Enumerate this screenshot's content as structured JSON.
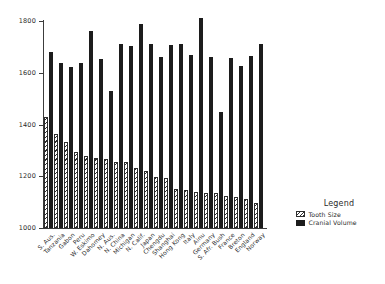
{
  "chart_data": {
    "type": "bar",
    "title": "",
    "subtitle": "",
    "xlabel": "",
    "ylabel": "",
    "ylim": [
      1000,
      1800
    ],
    "yticks": [
      1000,
      1200,
      1400,
      1600,
      1800
    ],
    "grid": false,
    "legend": {
      "title": "Legend",
      "position": "right",
      "entries": [
        {
          "name": "Tooth Size",
          "pattern": "diagonal-hatch"
        },
        {
          "name": "Cranial Volume",
          "pattern": "solid-black"
        }
      ]
    },
    "categories": [
      "S. Aus.",
      "Tanzania",
      "Gabon",
      "Peru",
      "W. Eskimo",
      "Dahomey",
      "N. Aus.",
      "N. China",
      "Michigan",
      "N. Calif.",
      "Japan",
      "Chengdu",
      "Shanghai",
      "Hong Kong",
      "Italy",
      "Ainu",
      "Germany",
      "S. Afr. Bush",
      "France",
      "Breton",
      "England",
      "Norway"
    ],
    "series": [
      {
        "name": "Tooth Size",
        "values": [
          1428,
          1362,
          1333,
          1292,
          1278,
          1270,
          1268,
          1256,
          1254,
          1233,
          1219,
          1198,
          1195,
          1149,
          1147,
          1138,
          1136,
          1135,
          1125,
          1120,
          1113,
          1095
        ]
      },
      {
        "name": "Cranial Volume",
        "values": [
          1680,
          1639,
          1622,
          1636,
          1760,
          1653,
          1530,
          1713,
          1704,
          1789,
          1711,
          1659,
          1706,
          1713,
          1670,
          1810,
          1661,
          1448,
          1658,
          1628,
          1666,
          1710
        ]
      }
    ]
  }
}
